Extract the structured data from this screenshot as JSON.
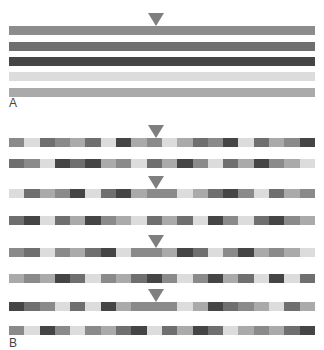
{
  "palette": {
    "L": "#dcdcdc",
    "LM": "#aaaaaa",
    "M": "#8a8a8a",
    "MD": "#6f6f6f",
    "D": "#454545"
  },
  "arrow_color": "#7f7f7f",
  "panel_a": {
    "label": "A",
    "bars": [
      {
        "color": "#8c8c8c"
      },
      {
        "color": "#6f6f6f"
      },
      {
        "color": "#454545"
      },
      {
        "color": "#dcdcdc"
      },
      {
        "color": "#aaaaaa"
      }
    ]
  },
  "panel_b": {
    "label": "B",
    "rows": [
      [
        "M",
        "L",
        "MD",
        "M",
        "LM",
        "MD",
        "L",
        "D",
        "LM",
        "M",
        "L",
        "LM",
        "MD",
        "M",
        "D",
        "L",
        "MD",
        "LM",
        "M",
        "D"
      ],
      [
        "MD",
        "M",
        "L",
        "D",
        "MD",
        "D",
        "LM",
        "M",
        "L",
        "MD",
        "LM",
        "D",
        "M",
        "L",
        "MD",
        "LM",
        "D",
        "M",
        "LM",
        "L"
      ],
      [
        "L",
        "MD",
        "LM",
        "M",
        "D",
        "L",
        "MD",
        "D",
        "LM",
        "M",
        "M",
        "L",
        "LM",
        "MD",
        "D",
        "M",
        "L",
        "MD",
        "LM",
        "M"
      ],
      [
        "MD",
        "D",
        "L",
        "MD",
        "LM",
        "D",
        "M",
        "LM",
        "L",
        "MD",
        "LM",
        "MD",
        "L",
        "D",
        "M",
        "L",
        "MD",
        "D",
        "M",
        "LM"
      ],
      [
        "M",
        "MD",
        "L",
        "M",
        "LM",
        "MD",
        "D",
        "L",
        "M",
        "M",
        "LM",
        "D",
        "MD",
        "L",
        "M",
        "D",
        "LM",
        "M",
        "LM",
        "L"
      ],
      [
        "LM",
        "M",
        "LM",
        "D",
        "MD",
        "L",
        "M",
        "LM",
        "MD",
        "D",
        "M",
        "L",
        "M",
        "D",
        "LM",
        "MD",
        "L",
        "D",
        "L",
        "MD"
      ],
      [
        "D",
        "MD",
        "M",
        "L",
        "MD",
        "L",
        "D",
        "LM",
        "M",
        "M",
        "M",
        "L",
        "LM",
        "D",
        "MD",
        "M",
        "LM",
        "L",
        "MD",
        "LM"
      ],
      [
        "M",
        "L",
        "D",
        "M",
        "L",
        "M",
        "LM",
        "MD",
        "D",
        "L",
        "MD",
        "LM",
        "D",
        "MD",
        "L",
        "LM",
        "M",
        "LM",
        "MD",
        "D"
      ]
    ],
    "arrow_rows": [
      0,
      2,
      4,
      6
    ]
  }
}
